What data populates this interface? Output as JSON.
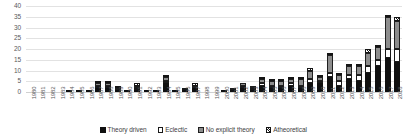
{
  "chart_data": {
    "type": "bar",
    "subtype": "stacked-vertical",
    "title": "",
    "subtitle": "",
    "xlabel": "",
    "ylabel": "",
    "ylim": [
      0,
      40
    ],
    "ytick_step": 5,
    "yticks": [
      40,
      35,
      30,
      25,
      20,
      15,
      10,
      5,
      0
    ],
    "ytick_labels": [
      "40",
      "35",
      "30",
      "25",
      "20",
      "15",
      "10",
      "5",
      "0"
    ],
    "grid": true,
    "grid_axis": "y",
    "legend_position": "bottom",
    "categories": [
      "1980",
      "1981",
      "1982",
      "1983",
      "1984",
      "1985",
      "1986",
      "1987",
      "1988",
      "1989",
      "1990",
      "1991",
      "1992",
      "1993",
      "1994",
      "1995",
      "1996",
      "1997",
      "1998",
      "1999",
      "2000",
      "2001",
      "2002",
      "2003",
      "2004",
      "2005",
      "2006",
      "2007",
      "2008",
      "2009",
      "2010",
      "2011",
      "2012",
      "2013",
      "2014",
      "2015",
      "2016",
      "2017",
      "2018"
    ],
    "series": [
      {
        "name": "Theory driven",
        "color": "#101010",
        "pattern": "solid-black",
        "values": [
          0,
          0,
          0,
          0,
          1,
          1,
          1,
          2,
          2,
          1,
          1,
          1,
          1,
          1,
          4,
          1,
          1,
          2,
          0,
          0,
          1,
          1,
          2,
          1,
          3,
          2,
          2,
          3,
          2,
          4,
          4,
          7,
          3,
          6,
          5,
          9,
          12,
          16,
          14
        ]
      },
      {
        "name": "Eclectic",
        "color": "#ffffff",
        "pattern": "white-outline",
        "values": [
          0,
          0,
          0,
          0,
          0,
          0,
          0,
          1,
          1,
          0,
          0,
          1,
          0,
          0,
          1,
          0,
          1,
          0,
          0,
          0,
          0,
          0,
          1,
          1,
          1,
          1,
          1,
          1,
          1,
          2,
          1,
          2,
          2,
          2,
          3,
          3,
          3,
          4,
          6
        ]
      },
      {
        "name": "No explicit theory",
        "color": "#8d8d8d",
        "pattern": "solid-gray",
        "values": [
          0,
          0,
          0,
          0,
          0,
          0,
          0,
          1,
          1,
          1,
          0,
          1,
          0,
          0,
          2,
          0,
          0,
          1,
          0,
          0,
          0,
          1,
          1,
          1,
          2,
          2,
          2,
          2,
          3,
          4,
          2,
          8,
          3,
          4,
          4,
          6,
          6,
          15,
          13
        ]
      },
      {
        "name": "Atheoretical",
        "color": "#151515",
        "pattern": "diagonal-hatch",
        "values": [
          0,
          0,
          0,
          0,
          0,
          0,
          0,
          1,
          1,
          1,
          0,
          1,
          0,
          0,
          1,
          0,
          0,
          1,
          0,
          0,
          0,
          0,
          0,
          0,
          1,
          1,
          1,
          1,
          1,
          1,
          1,
          1,
          1,
          1,
          1,
          2,
          1,
          1,
          2
        ]
      }
    ],
    "totals": [
      0,
      0,
      0,
      0,
      1,
      1,
      1,
      5,
      5,
      3,
      1,
      4,
      1,
      1,
      8,
      1,
      2,
      4,
      0,
      0,
      1,
      2,
      4,
      3,
      7,
      6,
      6,
      7,
      7,
      11,
      8,
      18,
      9,
      13,
      13,
      20,
      22,
      36,
      35
    ]
  },
  "legend": {
    "items": [
      {
        "label": "Theory driven",
        "swatch": "solid-black"
      },
      {
        "label": "Eclectic",
        "swatch": "white-outline"
      },
      {
        "label": "No explicit theory",
        "swatch": "solid-gray"
      },
      {
        "label": "Atheoretical",
        "swatch": "diagonal-hatch"
      }
    ]
  },
  "colors": {
    "theory_driven": "#101010",
    "eclectic": "#ffffff",
    "no_explicit_theory": "#8d8d8d",
    "atheoretical": "#151515",
    "gridline": "#e2e2e2",
    "tick_text": "#59595b",
    "background": "#ffffff"
  }
}
